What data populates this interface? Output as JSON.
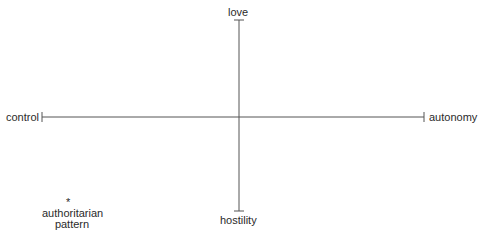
{
  "diagram": {
    "type": "two-axis-model",
    "axes": {
      "vertical": {
        "top_label": "love",
        "bottom_label": "hostility"
      },
      "horizontal": {
        "left_label": "control",
        "right_label": "autonomy"
      }
    },
    "points": [
      {
        "marker": "*",
        "label_line1": "authoritarian",
        "label_line2": "pattern",
        "quadrant": "control-hostility"
      }
    ],
    "colors": {
      "line": "#555555",
      "text": "#2a2a2a",
      "background": "#ffffff"
    }
  }
}
